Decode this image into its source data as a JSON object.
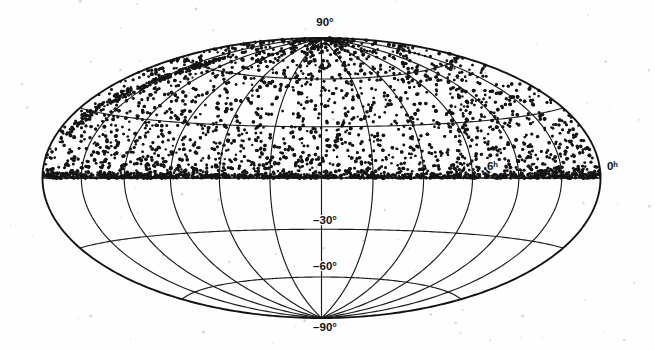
{
  "figure": {
    "kind": "all-sky-map",
    "projection": "Aitoff equal-area (Hammer) projection",
    "background_color": "#fefefe",
    "ink_color": "#141414",
    "grid_color": "#1b1b1b",
    "width": 655,
    "height": 351
  },
  "chart_data": {
    "type": "scatter",
    "title": "",
    "subtitle": "",
    "xlabel": "",
    "ylabel": "",
    "projection": "aitoff",
    "grid": true,
    "legend": false,
    "legend_position": "none",
    "coordinate_system": "equatorial",
    "x_axis": {
      "name": "Right Ascension",
      "unit": "hours",
      "range": [
        0,
        24
      ],
      "direction": "increasing to the left",
      "tick_interval_hours": 2,
      "labeled_ticks": [
        {
          "value": 6,
          "label": "6ʰ",
          "x": 487,
          "y": 170
        },
        {
          "value": 0,
          "label": "0ʰ",
          "x": 607,
          "y": 170
        }
      ]
    },
    "y_axis": {
      "name": "Declination",
      "unit": "degrees",
      "range": [
        -90,
        90
      ],
      "tick_interval_deg": 30,
      "labeled_ticks": [
        {
          "value": 90,
          "label": "90°",
          "x": 325,
          "y": 26
        },
        {
          "value": -30,
          "label": "–30°",
          "x": 325,
          "y": 224
        },
        {
          "value": -60,
          "label": "–60°",
          "x": 325,
          "y": 270
        },
        {
          "value": -90,
          "label": "–90°",
          "x": 325,
          "y": 331
        }
      ],
      "unlabeled_gridlines_deg": [
        60,
        30,
        0
      ]
    },
    "series": [
      {
        "name": "catalog sources",
        "marker": "dot",
        "marker_size_px": 1.4,
        "color": "#141414",
        "approx_point_count": 4200,
        "declination_coverage_deg": [
          0,
          90
        ],
        "description": "Survey objects densely filling the northern celestial hemisphere; the southern hemisphere (declination below 0 degrees) is empty, giving a sharp cutoff along the celestial equator.",
        "density_notes": [
          "highest concentration in a band just above the celestial equator",
          "a dense elongated clump near the upper-right limb around 1-3 hours right ascension",
          "sparse scattering near the north celestial pole",
          "thin high-density ridge exactly along the declination 0 degree line"
        ]
      }
    ]
  },
  "labels": {
    "dec_north_pole": "90°",
    "dec_minus_30": "–30°",
    "dec_minus_60": "–60°",
    "dec_south_pole": "–90°",
    "ra_6h": "6ʰ",
    "ra_0h": "0ʰ"
  }
}
